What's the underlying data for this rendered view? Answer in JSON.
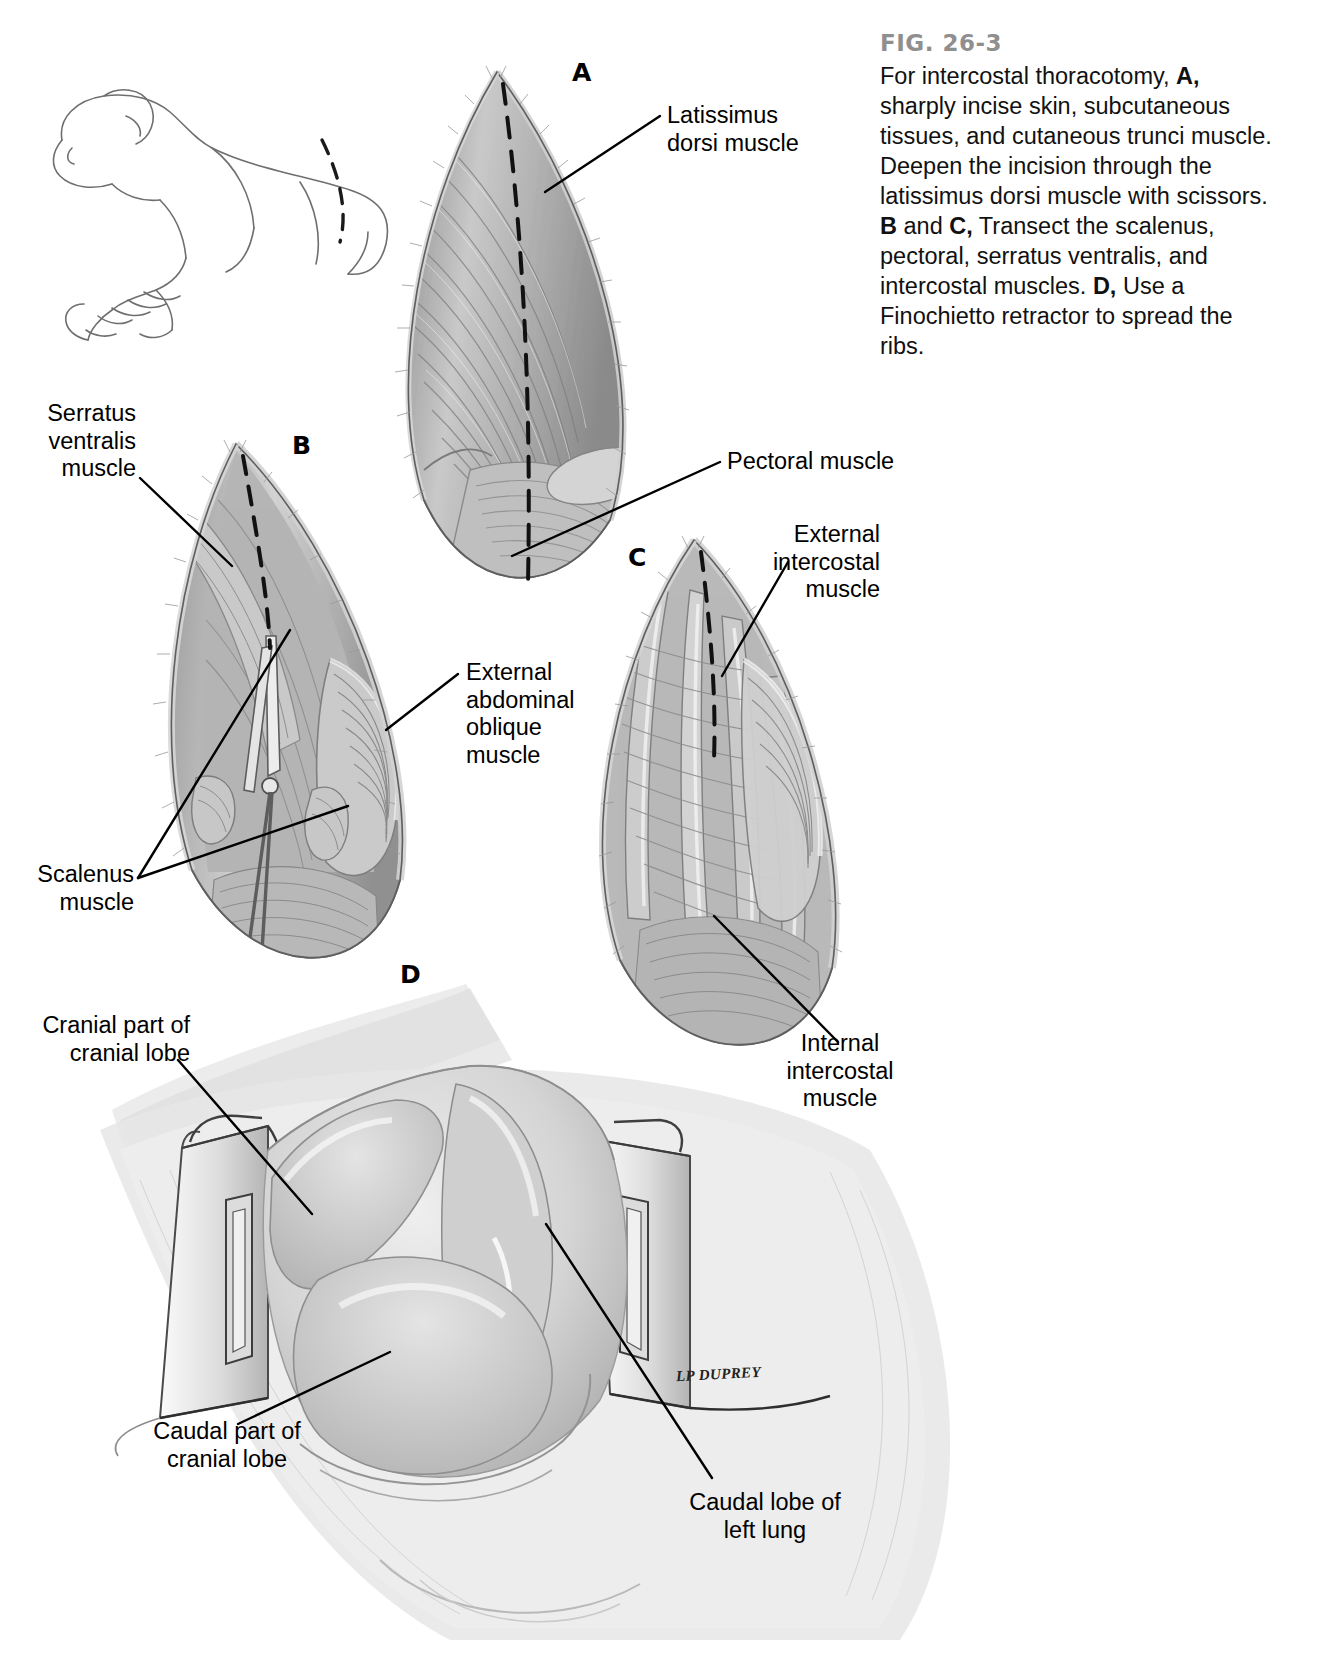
{
  "figure": {
    "number": "FIG. 26-3",
    "caption_runs": [
      {
        "t": "For intercostal thoracotomy, ",
        "b": false
      },
      {
        "t": "A,",
        "b": true
      },
      {
        "t": " sharply incise skin, subcutaneous tissues, and cutaneous trunci muscle. Deepen the incision through the latissimus dorsi muscle with scissors. ",
        "b": false
      },
      {
        "t": "B",
        "b": true
      },
      {
        "t": " and ",
        "b": false
      },
      {
        "t": "C,",
        "b": true
      },
      {
        "t": " Transect the scalenus, pectoral, serratus ventralis, and intercostal muscles. ",
        "b": false
      },
      {
        "t": "D,",
        "b": true
      },
      {
        "t": " Use a Finochietto retractor to spread the ribs.",
        "b": false
      }
    ],
    "caption_plain": "For intercostal thoracotomy, A, sharply incise skin, subcutaneous tissues, and cutaneous trunci muscle. Deepen the incision through the latissimus dorsi muscle with scissors. B and C, Transect the scalenus, pectoral, serratus ventralis, and intercostal muscles. D, Use a Finochietto retractor to spread the ribs.",
    "artist_credit": "LP DUPREY"
  },
  "panels": [
    {
      "id": "A",
      "letter": "A"
    },
    {
      "id": "B",
      "letter": "B"
    },
    {
      "id": "C",
      "letter": "C"
    },
    {
      "id": "D",
      "letter": "D"
    }
  ],
  "labels": {
    "latissimus_dorsi": "Latissimus\ndorsi muscle",
    "pectoral": "Pectoral muscle",
    "serratus_ventralis": "Serratus\nventralis\nmuscle",
    "external_abdominal_oblique": "External\nabdominal\noblique\nmuscle",
    "scalenus": "Scalenus\nmuscle",
    "external_intercostal": "External\nintercostal\nmuscle",
    "internal_intercostal": "Internal\nintercostal\nmuscle",
    "cranial_part_cranial_lobe": "Cranial part of\ncranial lobe",
    "caudal_part_cranial_lobe": "Caudal part of\ncranial lobe",
    "caudal_lobe_left_lung": "Caudal lobe of\nleft lung"
  },
  "colors": {
    "fig_number": "#8f8f8f",
    "text": "#111111",
    "leader_line": "#000000",
    "tissue_light": "#e9e9e9",
    "tissue_mid": "#bdbdbd",
    "tissue_dark": "#8a8a8a",
    "page_background": "#ffffff"
  }
}
